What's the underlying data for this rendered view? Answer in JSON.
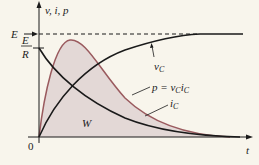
{
  "diagram": {
    "y_axis_label": "v, i, p",
    "x_axis_label": "t",
    "origin_label": "0",
    "level_E_label": "E",
    "level_ER_numerator": "E",
    "level_ER_denominator": "R",
    "curve_labels": {
      "vc": "vC",
      "p": "p = vCiC",
      "ic": "iC",
      "area": "W"
    },
    "colors": {
      "background": "#f8f5ec",
      "axes": "#1a1a1a",
      "vc_curve": "#1a1a1a",
      "ic_curve": "#1a1a1a",
      "p_curve": "#9a5a5e",
      "p_fill": "#e3d8d6"
    }
  }
}
